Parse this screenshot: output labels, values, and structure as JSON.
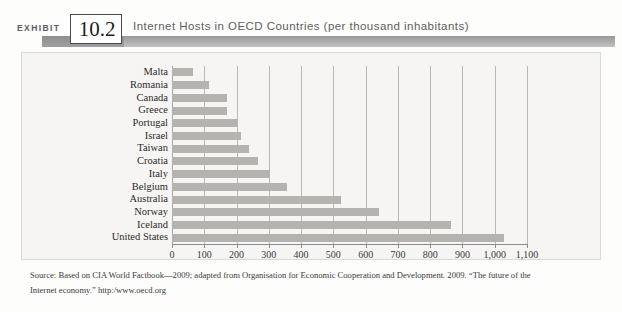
{
  "header": {
    "exhibit_word": "EXHIBIT",
    "exhibit_number": "10.2",
    "title": "Internet Hosts in OECD Countries (per thousand inhabitants)"
  },
  "source": {
    "line1": "Source: Based on CIA World Factbook—2009; adapted from Organisation for Economic Cooperation and Development. 2009. “The future of the",
    "line2": "Internet economy.”  http:/www.oecd.org"
  },
  "colors": {
    "bar": "#b5b3af",
    "gridline": "#b9b7b3",
    "panel_bg": "#f6f5f3",
    "header_band": "#a9a9a9",
    "axis": "#8d8b87"
  },
  "chart_data": {
    "type": "bar",
    "orientation": "horizontal",
    "title": "Internet Hosts in OECD Countries (per thousand inhabitants)",
    "xlabel": "",
    "ylabel": "",
    "xlim": [
      0,
      1100
    ],
    "xticks": [
      0,
      100,
      200,
      300,
      400,
      500,
      600,
      700,
      800,
      900,
      1000,
      1100
    ],
    "xtick_labels": [
      "0",
      "100",
      "200",
      "300",
      "400",
      "500",
      "600",
      "700",
      "800",
      "900",
      "1,000",
      "1,100"
    ],
    "grid": "vertical",
    "legend": "none",
    "categories": [
      "Malta",
      "Romania",
      "Canada",
      "Greece",
      "Portugal",
      "Israel",
      "Taiwan",
      "Croatia",
      "Italy",
      "Belgium",
      "Australia",
      "Norway",
      "Iceland",
      "United States"
    ],
    "values": [
      65,
      115,
      170,
      170,
      200,
      215,
      240,
      265,
      305,
      355,
      525,
      640,
      865,
      1030
    ]
  }
}
